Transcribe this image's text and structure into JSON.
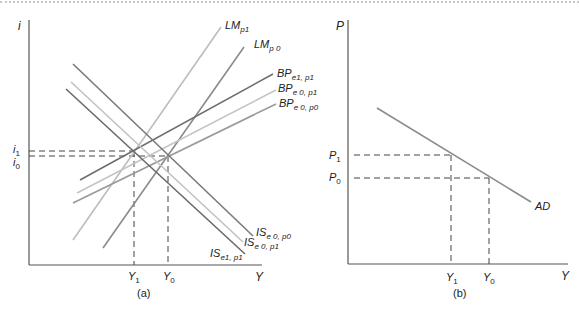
{
  "figure": {
    "panel_a": {
      "caption": "(a)",
      "y_axis_label": "i",
      "x_axis_label": "Y",
      "y_ticks": [
        {
          "base": "i",
          "sub": "1"
        },
        {
          "base": "i",
          "sub": "0"
        }
      ],
      "x_ticks": [
        {
          "base": "Y",
          "sub": "1"
        },
        {
          "base": "Y",
          "sub": "0"
        }
      ],
      "curves": [
        {
          "id": "LM_p1",
          "base": "LM",
          "sub": "p1",
          "color": "#bdbdbd"
        },
        {
          "id": "LM_p0",
          "base": "LM",
          "sub": "p 0",
          "color": "#8a8a8a"
        },
        {
          "id": "BP_e1p1",
          "base": "BP",
          "sub": "e1, p1",
          "color": "#6e6e6e"
        },
        {
          "id": "BP_e0p1",
          "base": "BP",
          "sub": "e 0, p1",
          "color": "#c4c4c4"
        },
        {
          "id": "BP_e0p0",
          "base": "BP",
          "sub": "e 0, p0",
          "color": "#9a9a9a"
        },
        {
          "id": "IS_e0p0",
          "base": "IS",
          "sub": "e 0, p0",
          "color": "#7a7a7a"
        },
        {
          "id": "IS_e0p1",
          "base": "IS",
          "sub": "e 0, p1",
          "color": "#c2c2c2"
        },
        {
          "id": "IS_e1p1",
          "base": "IS",
          "sub": "e1, p1",
          "color": "#6a6a6a"
        }
      ]
    },
    "panel_b": {
      "caption": "(b)",
      "y_axis_label": "P",
      "x_axis_label": "Y",
      "y_ticks": [
        {
          "base": "P",
          "sub": "1"
        },
        {
          "base": "P",
          "sub": "0"
        }
      ],
      "x_ticks": [
        {
          "base": "Y",
          "sub": "1"
        },
        {
          "base": "Y",
          "sub": "0"
        }
      ],
      "curves": [
        {
          "id": "AD",
          "base": "AD",
          "sub": "",
          "color": "#8c8c8c"
        }
      ]
    }
  }
}
